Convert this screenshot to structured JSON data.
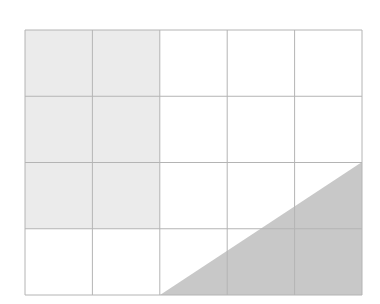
{
  "diagram": {
    "type": "grid-shading",
    "columns": 5,
    "rows": 4,
    "grid": {
      "x": 25,
      "y": 30,
      "width": 337,
      "height": 265
    },
    "shaded_cells": [
      {
        "row": 0,
        "col": 0
      },
      {
        "row": 0,
        "col": 1
      },
      {
        "row": 1,
        "col": 0
      },
      {
        "row": 1,
        "col": 1
      },
      {
        "row": 2,
        "col": 0
      },
      {
        "row": 2,
        "col": 1
      }
    ],
    "shaded_triangle": {
      "points": [
        [
          160,
          295
        ],
        [
          362,
          162
        ],
        [
          362,
          295
        ]
      ]
    },
    "colors": {
      "cell_fill": "#ebebeb",
      "triangle_fill": "#c8c8c8",
      "grid_line": "#b4b4b4",
      "background": "#ffffff"
    }
  }
}
